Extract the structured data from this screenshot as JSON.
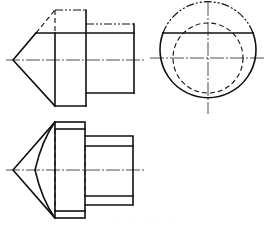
{
  "figure": {
    "type": "orthographic-projection",
    "views": [
      {
        "name": "front-view",
        "description": "cone-tipped stepped cylinder, truncated by horizontal plane"
      },
      {
        "name": "side-view",
        "description": "circle with dashed inner circle and horizontal cut chord"
      },
      {
        "name": "top-view",
        "description": "cone with hyperbolic section curve and stepped cylinders"
      }
    ],
    "colors": {
      "line": "#111111",
      "background": "#ffffff",
      "watermark": "#d8d8d8"
    },
    "caption": "· · · · · · · · · · · · · · ·"
  }
}
